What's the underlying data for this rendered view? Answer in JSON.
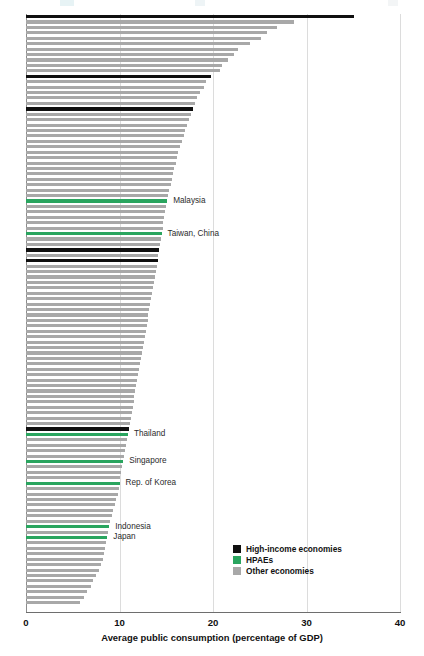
{
  "chart_data": {
    "type": "bar",
    "orientation": "horizontal",
    "title": "",
    "xlabel": "Average public consumption (percentage of GDP)",
    "ylabel": "",
    "xlim": [
      0,
      40
    ],
    "xticks": [
      0,
      10,
      20,
      30,
      40
    ],
    "grid": true,
    "grid_axis": "x",
    "legend_position": "bottom-right",
    "series": [
      {
        "name": "High-income economies",
        "color": "#101010",
        "key": "high"
      },
      {
        "name": "HPAEs",
        "color": "#2aa55f",
        "key": "hpae"
      },
      {
        "name": "Other economies",
        "color": "#a8a8a8",
        "key": "other"
      }
    ],
    "note": "Each bar is one economy, sorted descending by average public consumption. Only selected HPAE economies are labeled.",
    "bars": [
      {
        "value": 35.1,
        "group": "high",
        "label": ""
      },
      {
        "value": 28.7,
        "group": "other",
        "label": ""
      },
      {
        "value": 26.8,
        "group": "other",
        "label": ""
      },
      {
        "value": 25.8,
        "group": "other",
        "label": ""
      },
      {
        "value": 25.1,
        "group": "other",
        "label": ""
      },
      {
        "value": 24.0,
        "group": "other",
        "label": ""
      },
      {
        "value": 22.7,
        "group": "other",
        "label": ""
      },
      {
        "value": 22.2,
        "group": "other",
        "label": ""
      },
      {
        "value": 21.6,
        "group": "other",
        "label": ""
      },
      {
        "value": 21.0,
        "group": "other",
        "label": ""
      },
      {
        "value": 20.7,
        "group": "other",
        "label": ""
      },
      {
        "value": 19.8,
        "group": "high",
        "label": ""
      },
      {
        "value": 19.3,
        "group": "other",
        "label": ""
      },
      {
        "value": 19.0,
        "group": "other",
        "label": ""
      },
      {
        "value": 18.6,
        "group": "other",
        "label": ""
      },
      {
        "value": 18.3,
        "group": "other",
        "label": ""
      },
      {
        "value": 18.1,
        "group": "other",
        "label": ""
      },
      {
        "value": 17.9,
        "group": "high",
        "label": ""
      },
      {
        "value": 17.6,
        "group": "other",
        "label": ""
      },
      {
        "value": 17.4,
        "group": "other",
        "label": ""
      },
      {
        "value": 17.2,
        "group": "other",
        "label": ""
      },
      {
        "value": 17.0,
        "group": "other",
        "label": ""
      },
      {
        "value": 16.9,
        "group": "other",
        "label": ""
      },
      {
        "value": 16.7,
        "group": "other",
        "label": ""
      },
      {
        "value": 16.5,
        "group": "other",
        "label": ""
      },
      {
        "value": 16.3,
        "group": "other",
        "label": ""
      },
      {
        "value": 16.1,
        "group": "other",
        "label": ""
      },
      {
        "value": 16.0,
        "group": "other",
        "label": ""
      },
      {
        "value": 15.8,
        "group": "other",
        "label": ""
      },
      {
        "value": 15.7,
        "group": "other",
        "label": ""
      },
      {
        "value": 15.6,
        "group": "other",
        "label": ""
      },
      {
        "value": 15.5,
        "group": "other",
        "label": ""
      },
      {
        "value": 15.3,
        "group": "other",
        "label": ""
      },
      {
        "value": 15.2,
        "group": "other",
        "label": ""
      },
      {
        "value": 15.1,
        "group": "hpae",
        "label": "Malaysia"
      },
      {
        "value": 15.0,
        "group": "other",
        "label": ""
      },
      {
        "value": 14.9,
        "group": "other",
        "label": ""
      },
      {
        "value": 14.8,
        "group": "other",
        "label": ""
      },
      {
        "value": 14.7,
        "group": "other",
        "label": ""
      },
      {
        "value": 14.6,
        "group": "other",
        "label": ""
      },
      {
        "value": 14.5,
        "group": "hpae",
        "label": "Taiwan, China"
      },
      {
        "value": 14.4,
        "group": "other",
        "label": ""
      },
      {
        "value": 14.3,
        "group": "other",
        "label": ""
      },
      {
        "value": 14.2,
        "group": "high",
        "label": ""
      },
      {
        "value": 14.1,
        "group": "other",
        "label": ""
      },
      {
        "value": 14.1,
        "group": "high",
        "label": ""
      },
      {
        "value": 14.0,
        "group": "other",
        "label": ""
      },
      {
        "value": 13.9,
        "group": "other",
        "label": ""
      },
      {
        "value": 13.8,
        "group": "other",
        "label": ""
      },
      {
        "value": 13.7,
        "group": "other",
        "label": ""
      },
      {
        "value": 13.6,
        "group": "other",
        "label": ""
      },
      {
        "value": 13.5,
        "group": "other",
        "label": ""
      },
      {
        "value": 13.4,
        "group": "other",
        "label": ""
      },
      {
        "value": 13.3,
        "group": "other",
        "label": ""
      },
      {
        "value": 13.2,
        "group": "other",
        "label": ""
      },
      {
        "value": 13.1,
        "group": "other",
        "label": ""
      },
      {
        "value": 13.0,
        "group": "other",
        "label": ""
      },
      {
        "value": 12.9,
        "group": "other",
        "label": ""
      },
      {
        "value": 12.8,
        "group": "other",
        "label": ""
      },
      {
        "value": 12.7,
        "group": "other",
        "label": ""
      },
      {
        "value": 12.6,
        "group": "other",
        "label": ""
      },
      {
        "value": 12.5,
        "group": "other",
        "label": ""
      },
      {
        "value": 12.4,
        "group": "other",
        "label": ""
      },
      {
        "value": 12.3,
        "group": "other",
        "label": ""
      },
      {
        "value": 12.2,
        "group": "other",
        "label": ""
      },
      {
        "value": 12.1,
        "group": "other",
        "label": ""
      },
      {
        "value": 12.0,
        "group": "other",
        "label": ""
      },
      {
        "value": 11.9,
        "group": "other",
        "label": ""
      },
      {
        "value": 11.8,
        "group": "other",
        "label": ""
      },
      {
        "value": 11.7,
        "group": "other",
        "label": ""
      },
      {
        "value": 11.6,
        "group": "other",
        "label": ""
      },
      {
        "value": 11.5,
        "group": "other",
        "label": ""
      },
      {
        "value": 11.4,
        "group": "other",
        "label": ""
      },
      {
        "value": 11.3,
        "group": "other",
        "label": ""
      },
      {
        "value": 11.2,
        "group": "other",
        "label": ""
      },
      {
        "value": 11.1,
        "group": "other",
        "label": ""
      },
      {
        "value": 11.0,
        "group": "high",
        "label": ""
      },
      {
        "value": 10.9,
        "group": "hpae",
        "label": "Thailand"
      },
      {
        "value": 10.8,
        "group": "other",
        "label": ""
      },
      {
        "value": 10.7,
        "group": "other",
        "label": ""
      },
      {
        "value": 10.6,
        "group": "other",
        "label": ""
      },
      {
        "value": 10.5,
        "group": "other",
        "label": ""
      },
      {
        "value": 10.4,
        "group": "hpae",
        "label": "Singapore"
      },
      {
        "value": 10.3,
        "group": "other",
        "label": ""
      },
      {
        "value": 10.2,
        "group": "other",
        "label": ""
      },
      {
        "value": 10.1,
        "group": "other",
        "label": ""
      },
      {
        "value": 10.0,
        "group": "hpae",
        "label": "Rep. of Korea"
      },
      {
        "value": 9.9,
        "group": "other",
        "label": ""
      },
      {
        "value": 9.8,
        "group": "other",
        "label": ""
      },
      {
        "value": 9.6,
        "group": "other",
        "label": ""
      },
      {
        "value": 9.5,
        "group": "other",
        "label": ""
      },
      {
        "value": 9.3,
        "group": "other",
        "label": ""
      },
      {
        "value": 9.2,
        "group": "other",
        "label": ""
      },
      {
        "value": 9.0,
        "group": "other",
        "label": ""
      },
      {
        "value": 8.9,
        "group": "hpae",
        "label": "Indonesia"
      },
      {
        "value": 8.8,
        "group": "other",
        "label": ""
      },
      {
        "value": 8.7,
        "group": "hpae",
        "label": "Japan"
      },
      {
        "value": 8.6,
        "group": "other",
        "label": ""
      },
      {
        "value": 8.5,
        "group": "other",
        "label": ""
      },
      {
        "value": 8.3,
        "group": "other",
        "label": ""
      },
      {
        "value": 8.2,
        "group": "other",
        "label": ""
      },
      {
        "value": 8.0,
        "group": "other",
        "label": ""
      },
      {
        "value": 7.8,
        "group": "other",
        "label": ""
      },
      {
        "value": 7.5,
        "group": "other",
        "label": ""
      },
      {
        "value": 7.2,
        "group": "other",
        "label": ""
      },
      {
        "value": 6.9,
        "group": "other",
        "label": ""
      },
      {
        "value": 6.5,
        "group": "other",
        "label": ""
      },
      {
        "value": 6.2,
        "group": "other",
        "label": ""
      },
      {
        "value": 5.8,
        "group": "other",
        "label": ""
      }
    ]
  },
  "axis": {
    "tick_labels": [
      "0",
      "10",
      "20",
      "30",
      "40"
    ],
    "title": "Average public consumption (percentage of GDP)"
  },
  "legend": {
    "items": [
      {
        "label": "High-income economies",
        "color": "#101010"
      },
      {
        "label": "HPAEs",
        "color": "#2aa55f"
      },
      {
        "label": "Other economies",
        "color": "#a8a8a8"
      }
    ]
  },
  "colors": {
    "high_income": "#101010",
    "hpae": "#2aa55f",
    "other": "#a8a8a8",
    "grid": "#dcdcdc",
    "axis": "#6e6e6e",
    "background": "#ffffff"
  }
}
